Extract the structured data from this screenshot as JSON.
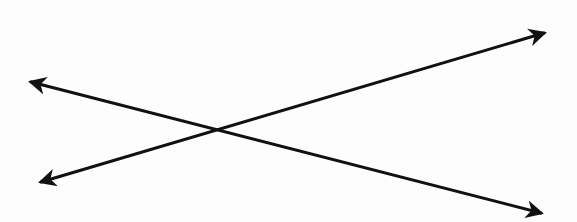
{
  "diagram": {
    "type": "intersecting-lines",
    "width": 577,
    "height": 222,
    "background": "#fdfdfd",
    "stroke_color": "#111111",
    "stroke_width": 3,
    "lines": [
      {
        "name": "line-1",
        "start": [
          31,
          82
        ],
        "end": [
          541,
          213
        ],
        "arrow_start": true,
        "arrow_end": true
      },
      {
        "name": "line-2",
        "start": [
          41,
          182
        ],
        "end": [
          544,
          33
        ],
        "arrow_start": true,
        "arrow_end": true
      }
    ],
    "intersection": [
      230,
      128
    ]
  }
}
